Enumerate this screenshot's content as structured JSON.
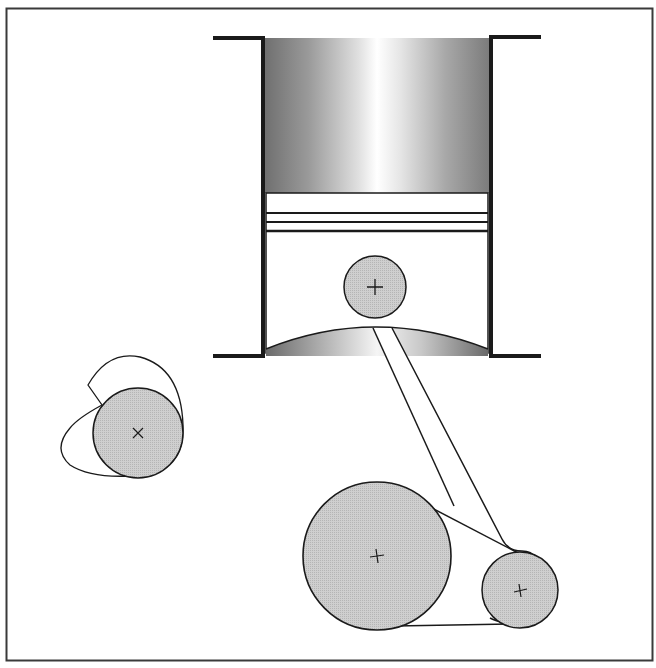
{
  "diagram": {
    "colors": {
      "background": "#ffffff",
      "frame": "#3a3a3a",
      "stroke": "#1a1a1a",
      "fill_gray": "#c4c4c4",
      "gradient_dark": "#6e6e6e",
      "gradient_light": "#ffffff"
    },
    "components": [
      {
        "id": "cylinder",
        "label": "Cylinder walls"
      },
      {
        "id": "piston",
        "label": "Piston with rings"
      },
      {
        "id": "wrist-pin",
        "label": "Wrist pin",
        "marker": "+"
      },
      {
        "id": "connecting-rod",
        "label": "Connecting rod"
      },
      {
        "id": "crank-wheel",
        "label": "Crank wheel",
        "marker": "+"
      },
      {
        "id": "crank-pin",
        "label": "Crank pin",
        "marker": "+"
      },
      {
        "id": "cam",
        "label": "Cam lobe",
        "marker": "×"
      }
    ],
    "piston_rings": 3
  }
}
